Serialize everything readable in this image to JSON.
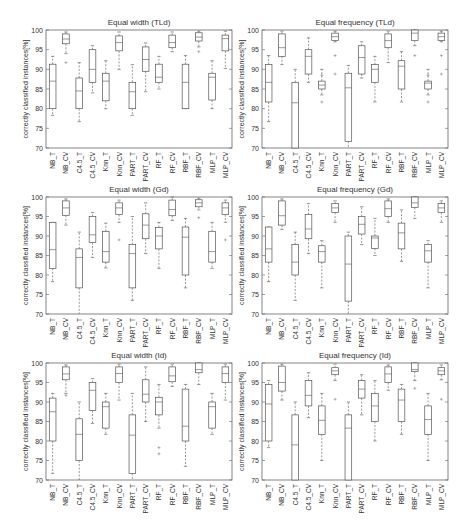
{
  "figure": {
    "ylabel": "correctly classified instances[%]",
    "yticks": [
      70,
      75,
      80,
      85,
      90,
      95,
      100
    ],
    "ylim": [
      70,
      100
    ],
    "categories": [
      "NB_T",
      "NB_CV",
      "C4.5_T",
      "C4.5_CV",
      "Knn_T",
      "Knn_CV",
      "PART_T",
      "PART_CV",
      "RF_T",
      "RF_CV",
      "RBF_T",
      "RBF_CV",
      "MLP_T",
      "MLP_CV"
    ]
  },
  "chart_data": [
    {
      "type": "box",
      "title": "Equal width (TLd)",
      "ylabel": "correctly classified instances[%]",
      "ylim": [
        70,
        100
      ],
      "categories": [
        "NB_T",
        "NB_CV",
        "C4.5_T",
        "C4.5_CV",
        "Knn_T",
        "Knn_CV",
        "PART_T",
        "PART_CV",
        "RF_T",
        "RF_CV",
        "RBF_T",
        "RBF_CV",
        "MLP_T",
        "MLP_CV"
      ],
      "boxes": [
        {
          "wlo": 78.3,
          "q1": 80,
          "med": 87,
          "q3": 91.3,
          "whi": 93.3,
          "out": []
        },
        {
          "wlo": 94,
          "q1": 96.5,
          "med": 97.7,
          "q3": 99,
          "whi": 99.5,
          "out": [
            91.7
          ]
        },
        {
          "wlo": 76.7,
          "q1": 80,
          "med": 84.5,
          "q3": 87.8,
          "whi": 91.7,
          "out": []
        },
        {
          "wlo": 84,
          "q1": 86.7,
          "med": 90,
          "q3": 95,
          "whi": 96,
          "out": []
        },
        {
          "wlo": 80,
          "q1": 82,
          "med": 87,
          "q3": 89,
          "whi": 92.2,
          "out": []
        },
        {
          "wlo": 90,
          "q1": 94.7,
          "med": 96.8,
          "q3": 98.5,
          "whi": 99.5,
          "out": []
        },
        {
          "wlo": 78.3,
          "q1": 80,
          "med": 84.3,
          "q3": 86.7,
          "whi": 91.2,
          "out": []
        },
        {
          "wlo": 84.3,
          "q1": 89.5,
          "med": 92.5,
          "q3": 95.7,
          "whi": 96.7,
          "out": []
        },
        {
          "wlo": 85,
          "q1": 86.7,
          "med": 88,
          "q3": 91.3,
          "whi": 93.3,
          "out": []
        },
        {
          "wlo": 94.5,
          "q1": 95.5,
          "med": 96.8,
          "q3": 98.7,
          "whi": 99.5,
          "out": []
        },
        {
          "wlo": 80,
          "q1": 80,
          "med": 86.7,
          "q3": 91.3,
          "whi": 93.5,
          "out": []
        },
        {
          "wlo": 95.7,
          "q1": 97.2,
          "med": 98.2,
          "q3": 99.3,
          "whi": 99.7,
          "out": [
            94.5
          ]
        },
        {
          "wlo": 80,
          "q1": 82.2,
          "med": 88,
          "q3": 89,
          "whi": 92.2,
          "out": []
        },
        {
          "wlo": 90.2,
          "q1": 94.7,
          "med": 97.8,
          "q3": 98.7,
          "whi": 99.7,
          "out": []
        }
      ]
    },
    {
      "type": "box",
      "title": "Equal frequency (TLd)",
      "ylabel": "correctly classified instances[%]",
      "ylim": [
        70,
        100
      ],
      "categories": [
        "NB_T",
        "NB_CV",
        "C4.5_T",
        "C4.5_CV",
        "Knn_T",
        "Knn_CV",
        "PART_T",
        "PART_CV",
        "RF_T",
        "RF_CV",
        "RBF_T",
        "RBF_CV",
        "MLP_T",
        "MLP_CV"
      ],
      "boxes": [
        {
          "wlo": 76.7,
          "q1": 81.7,
          "med": 86.7,
          "q3": 91.2,
          "whi": 93.5,
          "out": []
        },
        {
          "wlo": 91.2,
          "q1": 93.3,
          "med": 95.5,
          "q3": 99,
          "whi": 99.7,
          "out": []
        },
        {
          "wlo": 70,
          "q1": 70,
          "med": 81.5,
          "q3": 86.7,
          "whi": 90,
          "out": []
        },
        {
          "wlo": 86.7,
          "q1": 88.8,
          "med": 93.3,
          "q3": 95,
          "whi": 98,
          "out": []
        },
        {
          "wlo": 83.5,
          "q1": 85,
          "med": 86,
          "q3": 87,
          "whi": 90,
          "out": [
            81.7,
            88.5
          ]
        },
        {
          "wlo": 97,
          "q1": 97.3,
          "med": 98.3,
          "q3": 99.2,
          "whi": 99.7,
          "out": [
            93.5,
            88.8
          ]
        },
        {
          "wlo": 70,
          "q1": 71.7,
          "med": 85.3,
          "q3": 89,
          "whi": 91,
          "out": []
        },
        {
          "wlo": 87.8,
          "q1": 88.8,
          "med": 93,
          "q3": 96,
          "whi": 97,
          "out": []
        },
        {
          "wlo": 81.7,
          "q1": 86.7,
          "med": 90,
          "q3": 91.2,
          "whi": 93.3,
          "out": []
        },
        {
          "wlo": 91.7,
          "q1": 95.5,
          "med": 97.3,
          "q3": 99,
          "whi": 99.7,
          "out": []
        },
        {
          "wlo": 81.7,
          "q1": 85,
          "med": 90.8,
          "q3": 92.2,
          "whi": 94.5,
          "out": []
        },
        {
          "wlo": 96,
          "q1": 97.3,
          "med": 99.2,
          "q3": 100,
          "whi": 100,
          "out": [
            93.5
          ]
        },
        {
          "wlo": 83.5,
          "q1": 85,
          "med": 86.5,
          "q3": 87,
          "whi": 90,
          "out": [
            81.7,
            88.5
          ]
        },
        {
          "wlo": 97,
          "q1": 97.3,
          "med": 98.3,
          "q3": 99.2,
          "whi": 99.7,
          "out": [
            93.5,
            88.8
          ]
        }
      ]
    },
    {
      "type": "box",
      "title": "Equal width (Gd)",
      "ylabel": "correctly classified instances[%]",
      "ylim": [
        70,
        100
      ],
      "categories": [
        "NB_T",
        "NB_CV",
        "C4.5_T",
        "C4.5_CV",
        "Knn_T",
        "Knn_CV",
        "PART_T",
        "PART_CV",
        "RF_T",
        "RF_CV",
        "RBF_T",
        "RBF_CV",
        "MLP_T",
        "MLP_CV"
      ],
      "boxes": [
        {
          "wlo": 78.3,
          "q1": 81.7,
          "med": 86.5,
          "q3": 93.5,
          "whi": 93.5,
          "out": []
        },
        {
          "wlo": 92.8,
          "q1": 95.3,
          "med": 97.2,
          "q3": 99,
          "whi": 99.5,
          "out": []
        },
        {
          "wlo": 70,
          "q1": 76.7,
          "med": 84.5,
          "q3": 86.7,
          "whi": 91,
          "out": []
        },
        {
          "wlo": 84.5,
          "q1": 88.3,
          "med": 90.3,
          "q3": 95,
          "whi": 96,
          "out": []
        },
        {
          "wlo": 81.8,
          "q1": 83.3,
          "med": 86,
          "q3": 91.2,
          "whi": 93.3,
          "out": []
        },
        {
          "wlo": 93.5,
          "q1": 95.5,
          "med": 97.2,
          "q3": 98.5,
          "whi": 99.2,
          "out": [
            89
          ]
        },
        {
          "wlo": 73.5,
          "q1": 76.7,
          "med": 85.5,
          "q3": 87.8,
          "whi": 95,
          "out": []
        },
        {
          "wlo": 85.5,
          "q1": 89.3,
          "med": 92.8,
          "q3": 95.7,
          "whi": 98.5,
          "out": []
        },
        {
          "wlo": 81.7,
          "q1": 86.7,
          "med": 90,
          "q3": 92.2,
          "whi": 93.5,
          "out": []
        },
        {
          "wlo": 94,
          "q1": 95.2,
          "med": 96.8,
          "q3": 99.2,
          "whi": 100,
          "out": []
        },
        {
          "wlo": 76.7,
          "q1": 80,
          "med": 89.7,
          "q3": 92.3,
          "whi": 94.5,
          "out": []
        },
        {
          "wlo": 96.7,
          "q1": 97.5,
          "med": 98.5,
          "q3": 99.3,
          "whi": 99.7,
          "out": [
            94.7
          ]
        },
        {
          "wlo": 81.7,
          "q1": 83.3,
          "med": 86,
          "q3": 91.2,
          "whi": 93.5,
          "out": []
        },
        {
          "wlo": 93.5,
          "q1": 95.5,
          "med": 97.2,
          "q3": 98.5,
          "whi": 99.2,
          "out": [
            89
          ]
        }
      ]
    },
    {
      "type": "box",
      "title": "Equal frequency (Gd)",
      "ylabel": "correctly classified instances[%]",
      "ylim": [
        70,
        100
      ],
      "categories": [
        "NB_T",
        "NB_CV",
        "C4.5_T",
        "C4.5_CV",
        "Knn_T",
        "Knn_CV",
        "PART_T",
        "PART_CV",
        "RF_T",
        "RF_CV",
        "RBF_T",
        "RBF_CV",
        "MLP_T",
        "MLP_CV"
      ],
      "boxes": [
        {
          "wlo": 78.3,
          "q1": 83.3,
          "med": 86.7,
          "q3": 92.3,
          "whi": 92.3,
          "out": []
        },
        {
          "wlo": 91.7,
          "q1": 92.8,
          "med": 95.2,
          "q3": 99,
          "whi": 99.5,
          "out": []
        },
        {
          "wlo": 73.5,
          "q1": 80,
          "med": 83.3,
          "q3": 87.8,
          "whi": 91,
          "out": []
        },
        {
          "wlo": 85.5,
          "q1": 89.3,
          "med": 91.8,
          "q3": 95.5,
          "whi": 98.3,
          "out": []
        },
        {
          "wlo": 76.7,
          "q1": 83.3,
          "med": 86,
          "q3": 87.5,
          "whi": 88.8,
          "out": []
        },
        {
          "wlo": 93.5,
          "q1": 96,
          "med": 97.2,
          "q3": 98.3,
          "whi": 99,
          "out": []
        },
        {
          "wlo": 70,
          "q1": 73.3,
          "med": 82.8,
          "q3": 90,
          "whi": 91,
          "out": []
        },
        {
          "wlo": 87.8,
          "q1": 90.5,
          "med": 93,
          "q3": 95,
          "whi": 97.5,
          "out": []
        },
        {
          "wlo": 85,
          "q1": 86.8,
          "med": 89.5,
          "q3": 90,
          "whi": 94.5,
          "out": []
        },
        {
          "wlo": 93.5,
          "q1": 95,
          "med": 97,
          "q3": 99,
          "whi": 99.5,
          "out": []
        },
        {
          "wlo": 83.5,
          "q1": 86.7,
          "med": 90.8,
          "q3": 93.3,
          "whi": 96.7,
          "out": []
        },
        {
          "wlo": 94.5,
          "q1": 97.3,
          "med": 98.5,
          "q3": 100,
          "whi": 100,
          "out": []
        },
        {
          "wlo": 76.7,
          "q1": 83.3,
          "med": 86.2,
          "q3": 87.8,
          "whi": 88.8,
          "out": []
        },
        {
          "wlo": 93.5,
          "q1": 96,
          "med": 97.2,
          "q3": 98.3,
          "whi": 99,
          "out": []
        }
      ]
    },
    {
      "type": "box",
      "title": "Equal width (Id)",
      "ylabel": "correctly classified instances[%]",
      "ylim": [
        70,
        100
      ],
      "categories": [
        "NB_T",
        "NB_CV",
        "C4.5_T",
        "C4.5_CV",
        "Knn_T",
        "Knn_CV",
        "PART_T",
        "PART_CV",
        "RF_T",
        "RF_CV",
        "RBF_T",
        "RBF_CV",
        "MLP_T",
        "MLP_CV"
      ],
      "boxes": [
        {
          "wlo": 71.7,
          "q1": 80,
          "med": 87.5,
          "q3": 91,
          "whi": 92.2,
          "out": []
        },
        {
          "wlo": 92.2,
          "q1": 95.7,
          "med": 97.2,
          "q3": 99,
          "whi": 99.5,
          "out": [
            91.7
          ]
        },
        {
          "wlo": 70,
          "q1": 75,
          "med": 81.7,
          "q3": 85.7,
          "whi": 90,
          "out": []
        },
        {
          "wlo": 84.5,
          "q1": 87.8,
          "med": 93,
          "q3": 95,
          "whi": 96,
          "out": []
        },
        {
          "wlo": 81.7,
          "q1": 83.3,
          "med": 88.8,
          "q3": 90,
          "whi": 92.2,
          "out": []
        },
        {
          "wlo": 90.5,
          "q1": 95,
          "med": 97.3,
          "q3": 99,
          "whi": 99.7,
          "out": []
        },
        {
          "wlo": 70,
          "q1": 71.7,
          "med": 81.5,
          "q3": 86.7,
          "whi": 92.2,
          "out": []
        },
        {
          "wlo": 85,
          "q1": 90,
          "med": 92,
          "q3": 95.7,
          "whi": 99,
          "out": []
        },
        {
          "wlo": 83.3,
          "q1": 86.7,
          "med": 90,
          "q3": 91.2,
          "whi": 94.5,
          "out": [
            78.3,
            76.7
          ]
        },
        {
          "wlo": 94,
          "q1": 95.2,
          "med": 96.7,
          "q3": 99,
          "whi": 99.7,
          "out": []
        },
        {
          "wlo": 73.5,
          "q1": 80,
          "med": 83.8,
          "q3": 93.3,
          "whi": 94.5,
          "out": []
        },
        {
          "wlo": 94.5,
          "q1": 97.5,
          "med": 98.3,
          "q3": 100,
          "whi": 100,
          "out": []
        },
        {
          "wlo": 81.7,
          "q1": 83.3,
          "med": 88.8,
          "q3": 90,
          "whi": 92.2,
          "out": []
        },
        {
          "wlo": 90.5,
          "q1": 95,
          "med": 97.3,
          "q3": 99,
          "whi": 99.7,
          "out": []
        }
      ]
    },
    {
      "type": "box",
      "title": "Equal frequency (Id)",
      "ylabel": "correctly classified instances[%]",
      "ylim": [
        70,
        100
      ],
      "categories": [
        "NB_T",
        "NB_CV",
        "C4.5_T",
        "C4.5_CV",
        "Knn_T",
        "Knn_CV",
        "PART_T",
        "PART_CV",
        "RF_T",
        "RF_CV",
        "RBF_T",
        "RBF_CV",
        "MLP_T",
        "MLP_CV"
      ],
      "boxes": [
        {
          "wlo": 78.3,
          "q1": 80,
          "med": 89.5,
          "q3": 94.5,
          "whi": 95.5,
          "out": []
        },
        {
          "wlo": 90.5,
          "q1": 92.8,
          "med": 95,
          "q3": 99.2,
          "whi": 99.7,
          "out": []
        },
        {
          "wlo": 70,
          "q1": 70,
          "med": 79,
          "q3": 86.7,
          "whi": 90,
          "out": []
        },
        {
          "wlo": 86,
          "q1": 89,
          "med": 91.7,
          "q3": 95.5,
          "whi": 97.5,
          "out": []
        },
        {
          "wlo": 75,
          "q1": 81.7,
          "med": 85.3,
          "q3": 89,
          "whi": 92.2,
          "out": []
        },
        {
          "wlo": 95.5,
          "q1": 97,
          "med": 98,
          "q3": 98.8,
          "whi": 99.7,
          "out": [
            90.7
          ]
        },
        {
          "wlo": 70,
          "q1": 70,
          "med": 83.3,
          "q3": 86.7,
          "whi": 90,
          "out": []
        },
        {
          "wlo": 86.7,
          "q1": 91,
          "med": 93.3,
          "q3": 95.5,
          "whi": 97,
          "out": []
        },
        {
          "wlo": 80,
          "q1": 85,
          "med": 89,
          "q3": 92.2,
          "whi": 95.5,
          "out": []
        },
        {
          "wlo": 93,
          "q1": 95,
          "med": 97.2,
          "q3": 99,
          "whi": 99.5,
          "out": []
        },
        {
          "wlo": 81.7,
          "q1": 85,
          "med": 90.5,
          "q3": 93.3,
          "whi": 94.5,
          "out": []
        },
        {
          "wlo": 95.5,
          "q1": 97.8,
          "med": 98.3,
          "q3": 100,
          "whi": 100,
          "out": [
            93.5
          ]
        },
        {
          "wlo": 75,
          "q1": 81.7,
          "med": 85.5,
          "q3": 89,
          "whi": 92.2,
          "out": []
        },
        {
          "wlo": 95.7,
          "q1": 97,
          "med": 98,
          "q3": 98.8,
          "whi": 99.5,
          "out": [
            90.7
          ]
        }
      ]
    }
  ]
}
